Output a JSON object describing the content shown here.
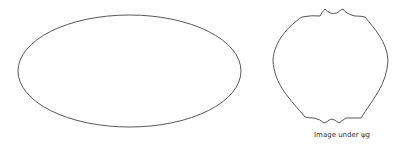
{
  "figure": {
    "left_shape": {
      "kind": "ellipse",
      "label": ""
    },
    "right_shape": {
      "kind": "distorted-ellipse",
      "caption": "Image under ψg"
    },
    "stroke_color": "#444444"
  }
}
